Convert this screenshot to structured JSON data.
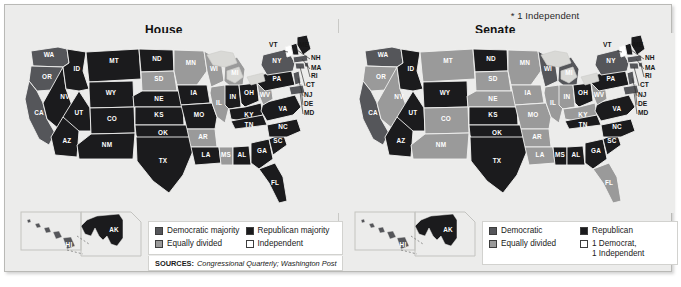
{
  "figure": {
    "footnote": "* 1 Independent",
    "sources_label": "SOURCES:",
    "sources_value": "Congressional Quarterly; Washington Post"
  },
  "colors": {
    "democratic": "#55565a",
    "republican": "#1b1b1d",
    "equally_divided": "#9a9a9a",
    "independent": "#ffffff",
    "background": "#ececeb",
    "panel_white": "#ffffff",
    "border": "#b9b9b6",
    "state_outline": "#f2f2f0",
    "lake": "#d9d9d6"
  },
  "panels": [
    {
      "id": "house",
      "title": "House",
      "legend": [
        {
          "label": "Democratic majority",
          "swatch": "#55565a"
        },
        {
          "label": "Republican majority",
          "swatch": "#1b1b1d"
        },
        {
          "label": "Equally divided",
          "swatch": "#9a9a9a"
        },
        {
          "label": "Independent",
          "swatch": "#ffffff"
        }
      ],
      "inset_labels": [
        "AK"
      ],
      "callouts": [
        "VT",
        "ME",
        "NH",
        "MA",
        "RI",
        "CT",
        "NJ",
        "DE",
        "MD"
      ],
      "states": {
        "WA": "democratic",
        "OR": "democratic",
        "CA": "democratic",
        "NV": "republican",
        "ID": "republican",
        "MT": "republican",
        "WY": "republican",
        "UT": "republican",
        "AZ": "republican",
        "NM": "republican",
        "CO": "republican",
        "ND": "republican",
        "SD": "equally_divided",
        "NE": "republican",
        "KS": "republican",
        "OK": "republican",
        "TX": "republican",
        "MN": "equally_divided",
        "IA": "republican",
        "MO": "republican",
        "AR": "equally_divided",
        "LA": "republican",
        "WI": "equally_divided",
        "IL": "equally_divided",
        "MS": "equally_divided",
        "AL": "republican",
        "MI": "equally_divided",
        "IN": "republican",
        "OH": "republican",
        "KY": "republican",
        "TN": "republican",
        "GA": "republican",
        "FL": "republican",
        "SC": "republican",
        "NC": "republican",
        "VA": "republican",
        "WV": "equally_divided",
        "PA": "republican",
        "NY": "democratic",
        "VT": "independent",
        "ME": "republican",
        "NH": "republican",
        "MA": "democratic",
        "RI": "democratic",
        "CT": "democratic",
        "NJ": "democratic",
        "DE": "democratic",
        "MD": "democratic",
        "AK": "republican",
        "HI": "democratic"
      }
    },
    {
      "id": "senate",
      "title": "Senate",
      "legend": [
        {
          "label": "Democratic",
          "swatch": "#55565a"
        },
        {
          "label": "Republican",
          "swatch": "#1b1b1d"
        },
        {
          "label": "Equally divided",
          "swatch": "#9a9a9a"
        },
        {
          "label": "1 Democrat,",
          "label2": "1 Independent",
          "swatch": "#ffffff"
        }
      ],
      "inset_labels": [
        "AK"
      ],
      "callouts": [
        "VT",
        "ME",
        "NH",
        "MA",
        "RI",
        "CT",
        "NJ",
        "DE",
        "MD"
      ],
      "states": {
        "WA": "democratic",
        "OR": "equally_divided",
        "CA": "democratic",
        "NV": "equally_divided",
        "ID": "republican",
        "MT": "equally_divided",
        "WY": "republican",
        "UT": "republican",
        "AZ": "republican",
        "NM": "equally_divided",
        "CO": "equally_divided",
        "ND": "republican",
        "SD": "equally_divided",
        "NE": "equally_divided",
        "KS": "republican",
        "OK": "republican",
        "TX": "republican",
        "MN": "equally_divided",
        "IA": "equally_divided",
        "MO": "equally_divided",
        "AR": "equally_divided",
        "LA": "equally_divided",
        "WI": "democratic",
        "IL": "equally_divided",
        "MS": "republican",
        "AL": "republican",
        "MI": "democratic",
        "IN": "equally_divided",
        "OH": "republican",
        "KY": "equally_divided",
        "TN": "republican",
        "GA": "republican",
        "FL": "equally_divided",
        "SC": "republican",
        "NC": "republican",
        "VA": "republican",
        "WV": "equally_divided",
        "PA": "republican",
        "NY": "democratic",
        "VT": "independent",
        "ME": "republican",
        "NH": "republican",
        "MA": "democratic",
        "RI": "democratic",
        "CT": "democratic",
        "NJ": "democratic",
        "DE": "democratic",
        "MD": "democratic",
        "AK": "republican",
        "HI": "democratic"
      }
    }
  ],
  "chart_data": {
    "type": "heatmap",
    "subtitle": "* 1 Independent",
    "legend_position": "bottom",
    "categories": [
      "AL",
      "AK",
      "AZ",
      "AR",
      "CA",
      "CO",
      "CT",
      "DE",
      "FL",
      "GA",
      "HI",
      "ID",
      "IL",
      "IN",
      "IA",
      "KS",
      "KY",
      "LA",
      "ME",
      "MD",
      "MA",
      "MI",
      "MN",
      "MS",
      "MO",
      "MT",
      "NE",
      "NV",
      "NH",
      "NJ",
      "NM",
      "NY",
      "NC",
      "ND",
      "OH",
      "OK",
      "OR",
      "PA",
      "RI",
      "SC",
      "SD",
      "TN",
      "TX",
      "UT",
      "VT",
      "VA",
      "WA",
      "WV",
      "WI",
      "WY"
    ],
    "series": [
      {
        "name": "House",
        "values": [
          "republican",
          "republican",
          "republican",
          "equally_divided",
          "democratic",
          "republican",
          "democratic",
          "democratic",
          "republican",
          "republican",
          "democratic",
          "republican",
          "equally_divided",
          "republican",
          "republican",
          "republican",
          "republican",
          "republican",
          "republican",
          "democratic",
          "democratic",
          "equally_divided",
          "equally_divided",
          "equally_divided",
          "republican",
          "republican",
          "republican",
          "republican",
          "republican",
          "democratic",
          "republican",
          "democratic",
          "republican",
          "republican",
          "republican",
          "republican",
          "democratic",
          "republican",
          "democratic",
          "republican",
          "equally_divided",
          "republican",
          "republican",
          "republican",
          "independent",
          "republican",
          "democratic",
          "equally_divided",
          "equally_divided",
          "republican"
        ]
      },
      {
        "name": "Senate",
        "values": [
          "republican",
          "republican",
          "republican",
          "equally_divided",
          "democratic",
          "equally_divided",
          "democratic",
          "democratic",
          "equally_divided",
          "republican",
          "democratic",
          "republican",
          "equally_divided",
          "equally_divided",
          "equally_divided",
          "republican",
          "equally_divided",
          "equally_divided",
          "republican",
          "democratic",
          "democratic",
          "democratic",
          "equally_divided",
          "republican",
          "equally_divided",
          "equally_divided",
          "equally_divided",
          "equally_divided",
          "republican",
          "democratic",
          "equally_divided",
          "democratic",
          "republican",
          "republican",
          "republican",
          "republican",
          "equally_divided",
          "republican",
          "democratic",
          "republican",
          "equally_divided",
          "republican",
          "republican",
          "republican",
          "independent",
          "republican",
          "democratic",
          "equally_divided",
          "democratic",
          "republican"
        ]
      }
    ],
    "value_legend": {
      "democratic": "Democratic majority",
      "republican": "Republican majority",
      "equally_divided": "Equally divided",
      "independent": "Independent"
    },
    "xlabel": "",
    "ylabel": "",
    "source": "SOURCES: Congressional Quarterly; Washington Post"
  }
}
